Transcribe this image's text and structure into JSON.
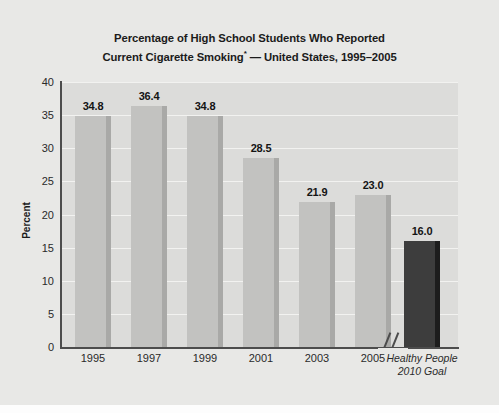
{
  "chart_data": {
    "type": "bar",
    "title": "Percentage of High School Students Who Reported Current Cigarette Smoking* — United States, 1995–2005",
    "title_line1": "Percentage of High School Students Who Reported",
    "title_line2_pre": "Current Cigarette Smoking",
    "title_line2_sup": "*",
    "title_line2_post": " — United States, 1995–2005",
    "xlabel": "",
    "ylabel": "Percent",
    "ylim": [
      0,
      40
    ],
    "ytick_labels": [
      "40",
      "35",
      "30",
      "25",
      "20",
      "15",
      "10",
      "5",
      "0"
    ],
    "ytick_values": [
      40,
      35,
      30,
      25,
      20,
      15,
      10,
      5,
      0
    ],
    "grid": true,
    "legend": "none",
    "categories": [
      "1995",
      "1997",
      "1999",
      "2001",
      "2003",
      "2005",
      "Healthy People 2010 Goal"
    ],
    "values": [
      34.8,
      36.4,
      34.8,
      28.5,
      21.9,
      23.0,
      16.0
    ],
    "value_labels": [
      "34.8",
      "36.4",
      "34.8",
      "28.5",
      "21.9",
      "23.0",
      "16.0"
    ],
    "bar_colors": [
      "#c2c2c0",
      "#c2c2c0",
      "#c2c2c0",
      "#c2c2c0",
      "#c2c2c0",
      "#c2c2c0",
      "#3d3d3d"
    ],
    "goal_label_line1": "Healthy People",
    "goal_label_line2": "2010 Goal",
    "axis_break": true,
    "axis_break_note": "//"
  },
  "colors": {
    "background": "#e8e8e6",
    "plot_background": "#dcdcda",
    "gridline": "#f2f2f0",
    "axis": "#4c4c4c",
    "bar_light": "#c2c2c0",
    "bar_light_side": "#a9a9a7",
    "bar_dark": "#3d3d3d",
    "bar_dark_side": "#1d1d1d",
    "text": "#1b1b1b"
  }
}
